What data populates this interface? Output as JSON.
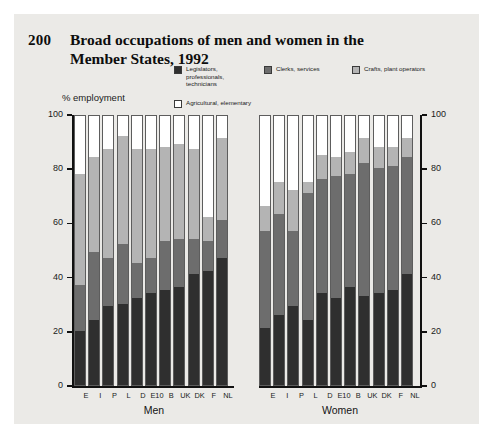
{
  "figure": {
    "number": "200",
    "title": "Broad occupations of men and women in the Member States, 1992",
    "axis_caption": "% employment",
    "background_color": "#ebeae7"
  },
  "legend": {
    "items": [
      {
        "key": "legislators",
        "label": "Legislators,\nprofessionals,\ntechnicians",
        "color": "#2f2f2f"
      },
      {
        "key": "clerks",
        "label": "Clerks, services",
        "color": "#6d6d6d"
      },
      {
        "key": "crafts",
        "label": "Crafts, plant operators",
        "color": "#b4b4b4"
      },
      {
        "key": "agricultural",
        "label": "Agricultural, elementary",
        "color": "#ffffff"
      }
    ]
  },
  "groups": {
    "men": "Men",
    "women": "Women"
  },
  "axis": {
    "ticks": [
      "0",
      "20",
      "40",
      "60",
      "80",
      "100"
    ],
    "min": 0,
    "max": 100
  },
  "chart_data": {
    "type": "bar",
    "title": "Broad occupations of men and women in the Member States, 1992",
    "xlabel": "",
    "ylabel": "% employment",
    "ylim": [
      0,
      100
    ],
    "stacked": true,
    "grid": false,
    "legend_position": "top",
    "categories": [
      "E",
      "I",
      "P",
      "L",
      "D",
      "E10",
      "B",
      "UK",
      "DK",
      "F",
      "NL"
    ],
    "panels": [
      {
        "name": "Men",
        "series": [
          {
            "name": "Legislators, professionals, technicians",
            "color": "#2f2f2f",
            "values": [
              20,
              24,
              29,
              30,
              32,
              34,
              35,
              36,
              41,
              42,
              47
            ]
          },
          {
            "name": "Clerks, services",
            "color": "#6d6d6d",
            "values": [
              17,
              25,
              18,
              22,
              13,
              13,
              18,
              18,
              13,
              11,
              14
            ]
          },
          {
            "name": "Crafts, plant operators",
            "color": "#b4b4b4",
            "values": [
              41,
              35,
              40,
              40,
              42,
              40,
              35,
              35,
              33,
              9,
              30
            ]
          },
          {
            "name": "Agricultural, elementary",
            "color": "#ffffff",
            "values": [
              22,
              16,
              13,
              8,
              13,
              13,
              12,
              11,
              13,
              38,
              9
            ]
          }
        ]
      },
      {
        "name": "Women",
        "series": [
          {
            "name": "Legislators, professionals, technicians",
            "color": "#2f2f2f",
            "values": [
              21,
              26,
              29,
              24,
              34,
              32,
              36,
              33,
              34,
              35,
              41
            ]
          },
          {
            "name": "Clerks, services",
            "color": "#6d6d6d",
            "values": [
              36,
              37,
              28,
              47,
              42,
              45,
              42,
              49,
              46,
              46,
              43
            ]
          },
          {
            "name": "Crafts, plant operators",
            "color": "#b4b4b4",
            "values": [
              9,
              12,
              15,
              4,
              9,
              7,
              8,
              9,
              8,
              7,
              7
            ]
          },
          {
            "name": "Agricultural, elementary",
            "color": "#ffffff",
            "values": [
              34,
              25,
              28,
              25,
              15,
              16,
              14,
              9,
              12,
              12,
              9
            ]
          }
        ]
      }
    ]
  }
}
